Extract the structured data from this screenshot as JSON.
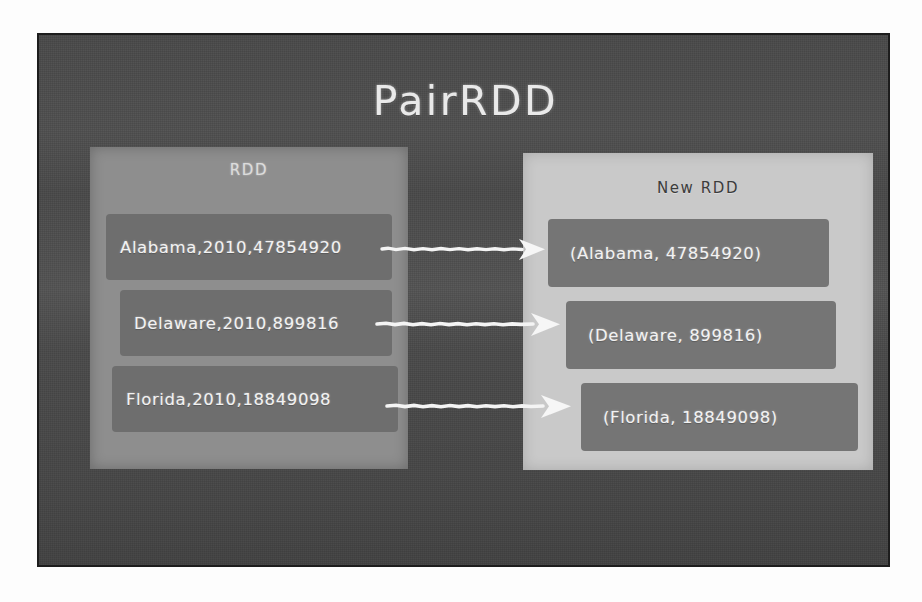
{
  "slide": {
    "title": "PairRDD",
    "background_color": "#4b4b4b",
    "border_color": "#1d1d1d",
    "page_background": "#fdfdfd"
  },
  "panels": {
    "source": {
      "title": "RDD",
      "background_color": "#8e8e8e",
      "text_color": "#dcdcdc",
      "records": [
        {
          "text": "Alabama,2010,47854920"
        },
        {
          "text": "Delaware,2010,899816"
        },
        {
          "text": "Florida,2010,18849098"
        }
      ]
    },
    "target": {
      "title": "New RDD",
      "background_color": "#c9c9c9",
      "text_color": "#3c3c3c",
      "records": [
        {
          "text": "(Alabama, 47854920)"
        },
        {
          "text": "(Delaware, 899816)"
        },
        {
          "text": "(Florida, 18849098)"
        }
      ]
    }
  },
  "arrows": [
    {
      "name": "arrow-alabama",
      "label": "maps Alabama record to pair",
      "color": "#f4f4f4"
    },
    {
      "name": "arrow-delaware",
      "label": "maps Delaware record to pair",
      "color": "#f4f4f4"
    },
    {
      "name": "arrow-florida",
      "label": "maps Florida record to pair",
      "color": "#f4f4f4"
    }
  ]
}
